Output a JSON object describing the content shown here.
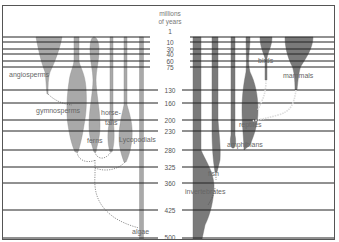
{
  "axis": {
    "title_line1": "millions",
    "title_line2": "of years",
    "ticks": [
      "1",
      "10",
      "30",
      "40",
      "60",
      "75",
      "130",
      "160",
      "200",
      "230",
      "280",
      "325",
      "360",
      "425",
      "500"
    ]
  },
  "plants": {
    "angiosperms": "angiosperms",
    "gymnosperms": "gymnosperms",
    "horsetails_1": "horse-",
    "horsetails_2": "tails",
    "ferns": "ferns",
    "lycopodials": "Lycopodials",
    "algae": "algae"
  },
  "animals": {
    "birds": "birds",
    "mammals": "mammals",
    "reptiles": "reptiles",
    "amphibians": "amphibians",
    "fish": "fish",
    "invertebrates": "invertebrates"
  },
  "colors": {
    "plants": "#a9a9a9",
    "animals": "#7a7a7a",
    "lines": "#222222"
  }
}
